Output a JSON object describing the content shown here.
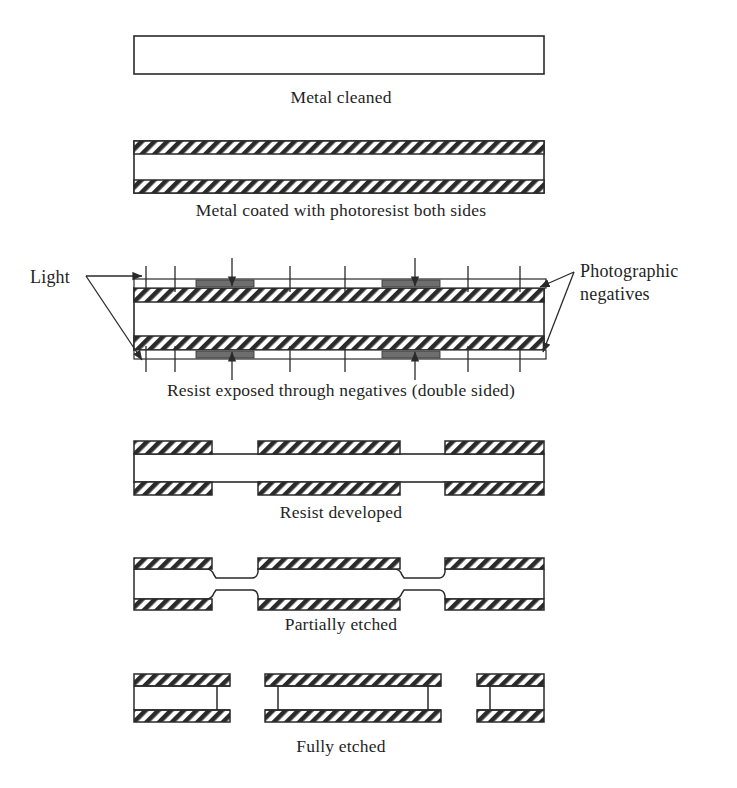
{
  "figure": {
    "background_color": "#ffffff",
    "line_color": "#2a2a2a",
    "opaque_color": "#6e6e6e",
    "hatch_color": "#2a2a2a"
  },
  "stages": [
    {
      "id": "metal-cleaned",
      "caption": "Metal cleaned",
      "caption_x": 341,
      "caption_y": 103,
      "sheet": {
        "x": 134,
        "y": 36,
        "width": 410,
        "height": 38
      }
    },
    {
      "id": "metal-coated",
      "caption": "Metal coated with photoresist both sides",
      "caption_x": 341,
      "caption_y": 216,
      "sheet": {
        "x": 134,
        "y": 141,
        "width": 410,
        "height": 52
      },
      "resist_top": {
        "x": 134,
        "y": 141,
        "width": 410,
        "height": 13
      },
      "resist_bottom": {
        "x": 134,
        "y": 180,
        "width": 410,
        "height": 13
      }
    },
    {
      "id": "resist-exposed",
      "caption": "Resist exposed through negatives (double sided)",
      "caption_x": 341,
      "caption_y": 396,
      "sheet": {
        "x": 134,
        "y": 288,
        "width": 410,
        "height": 62
      },
      "resist_top": {
        "x": 134,
        "y": 288,
        "width": 410,
        "height": 14
      },
      "resist_bottom": {
        "x": 134,
        "y": 336,
        "width": 410,
        "height": 14
      },
      "negative_top": {
        "x": 134,
        "y": 280,
        "width": 412,
        "height": 8
      },
      "negative_bottom": {
        "x": 134,
        "y": 350,
        "width": 412,
        "height": 8
      },
      "opaque_segments": [
        {
          "x": 196,
          "width": 58
        },
        {
          "x": 382,
          "width": 58
        }
      ],
      "tick_marks_x": [
        146,
        175,
        230,
        290,
        345,
        413,
        468,
        520
      ],
      "light_arrows_x": [
        232,
        415
      ],
      "labels": {
        "light": "Light",
        "negatives_line1": "Photographic",
        "negatives_line2": "negatives"
      }
    },
    {
      "id": "resist-developed",
      "caption": "Resist developed",
      "caption_x": 341,
      "caption_y": 518,
      "sheet": {
        "x": 134,
        "y": 441,
        "width": 410,
        "height": 54
      },
      "resist_segments": [
        {
          "x": 134,
          "width": 78
        },
        {
          "x": 258,
          "width": 142
        },
        {
          "x": 445,
          "width": 99
        }
      ],
      "resist_thickness": 13,
      "resist_top_y": 441,
      "resist_bottom_y": 482
    },
    {
      "id": "partially-etched",
      "caption": "Partially etched",
      "caption_x": 341,
      "caption_y": 630,
      "sheet": {
        "x": 134,
        "y": 558,
        "width": 410,
        "height": 52
      },
      "resist_segments": [
        {
          "x": 134,
          "width": 78
        },
        {
          "x": 258,
          "width": 142
        },
        {
          "x": 445,
          "width": 99
        }
      ],
      "etch_recesses": [
        {
          "start": 212,
          "end": 258
        },
        {
          "start": 400,
          "end": 445
        }
      ],
      "recess_depth": 9,
      "resist_thickness": 11,
      "resist_top_y": 558,
      "resist_bottom_y": 599
    },
    {
      "id": "fully-etched",
      "caption": "Fully etched",
      "caption_x": 341,
      "caption_y": 752,
      "pieces": [
        {
          "x": 134,
          "width": 96,
          "wall_x": 217,
          "wall_side": "right"
        },
        {
          "x": 265,
          "width": 176,
          "wall_left_x": 278,
          "wall_right_x": 428
        },
        {
          "x": 477,
          "width": 67,
          "wall_x": 490,
          "wall_side": "left"
        }
      ],
      "piece_top_y": 674,
      "piece_bottom_y": 710,
      "resist_thickness": 12
    }
  ]
}
